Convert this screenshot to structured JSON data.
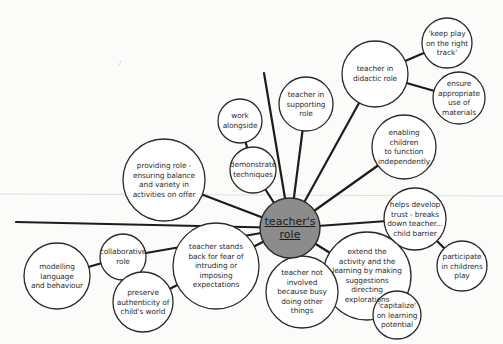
{
  "diagram": {
    "center": {
      "id": "center",
      "x": 290,
      "y": 228,
      "r": 30,
      "lines": [
        "teacher's",
        "role"
      ],
      "fill": "#8c8c8c"
    },
    "nodes": [
      {
        "id": "work-alongside",
        "x": 240,
        "y": 121,
        "r": 22,
        "lines": [
          "work",
          "alongside"
        ]
      },
      {
        "id": "demonstrate-techniques",
        "x": 253,
        "y": 170,
        "r": 23,
        "lines": [
          "demonstrate",
          "techniques"
        ]
      },
      {
        "id": "teacher-in-supporting-role",
        "x": 306,
        "y": 104,
        "r": 27,
        "lines": [
          "teacher in",
          "supporting",
          "role"
        ]
      },
      {
        "id": "teacher-in-didactic-role",
        "x": 375,
        "y": 74,
        "r": 33,
        "lines": [
          "teacher in",
          "didactic role"
        ]
      },
      {
        "id": "keep-play-on-track",
        "x": 447,
        "y": 43,
        "r": 25,
        "lines": [
          "'keep play",
          "on the right",
          "track'"
        ]
      },
      {
        "id": "ensure-appropriate-use",
        "x": 459,
        "y": 98,
        "r": 26,
        "lines": [
          "ensure",
          "appropriate",
          "use of",
          "materials"
        ]
      },
      {
        "id": "enabling-children",
        "x": 404,
        "y": 147,
        "r": 32,
        "lines": [
          "enabling",
          "children",
          "to function",
          "independently"
        ]
      },
      {
        "id": "providing-role",
        "x": 164,
        "y": 180,
        "r": 41,
        "lines": [
          "providing role -",
          "ensuring balance",
          "and variety in",
          "activities on offer"
        ]
      },
      {
        "id": "helps-develop-trust",
        "x": 415,
        "y": 219,
        "r": 31,
        "lines": [
          "helps develop",
          "trust - breaks",
          "down teacher...",
          "child barrier"
        ]
      },
      {
        "id": "participate-in-play",
        "x": 462,
        "y": 266,
        "r": 25,
        "lines": [
          "participate",
          "in childrens",
          "play"
        ]
      },
      {
        "id": "extend-the-activity",
        "x": 367,
        "y": 276,
        "r": 44,
        "lines": [
          "extend the",
          "activity and the",
          "learning by making",
          "suggestions",
          "directing",
          "explorations"
        ]
      },
      {
        "id": "capitalize-on-learning",
        "x": 397,
        "y": 315,
        "r": 24,
        "lines": [
          "'capitalize'",
          "on learning",
          "potential"
        ]
      },
      {
        "id": "teacher-not-involved",
        "x": 302,
        "y": 292,
        "r": 36,
        "lines": [
          "teacher not",
          "involved",
          "because busy",
          "doing other",
          "things"
        ]
      },
      {
        "id": "teacher-stands-back",
        "x": 216,
        "y": 266,
        "r": 43,
        "lines": [
          "teacher stands",
          "back for fear of",
          "intruding or",
          "imposing",
          "expectations"
        ]
      },
      {
        "id": "collaborative-role",
        "x": 123,
        "y": 257,
        "r": 23,
        "lines": [
          "collaborative",
          "role"
        ]
      },
      {
        "id": "modelling-language",
        "x": 57,
        "y": 276,
        "r": 33,
        "lines": [
          "modelling",
          "language",
          "and behaviour"
        ]
      },
      {
        "id": "preserve-authenticity",
        "x": 143,
        "y": 302,
        "r": 30,
        "lines": [
          "preserve",
          "authenticity of",
          "child's world"
        ]
      }
    ],
    "edges": [
      [
        "center",
        "demonstrate-techniques"
      ],
      [
        "work-alongside",
        "demonstrate-techniques"
      ],
      [
        "center",
        "teacher-in-supporting-role"
      ],
      [
        "center",
        "teacher-in-didactic-role"
      ],
      [
        "teacher-in-didactic-role",
        "keep-play-on-track"
      ],
      [
        "teacher-in-didactic-role",
        "ensure-appropriate-use"
      ],
      [
        "center",
        "enabling-children"
      ],
      [
        "center",
        "providing-role"
      ],
      [
        "center",
        "helps-develop-trust"
      ],
      [
        "helps-develop-trust",
        "participate-in-play"
      ],
      [
        "center",
        "extend-the-activity"
      ],
      [
        "extend-the-activity",
        "capitalize-on-learning"
      ],
      [
        "center",
        "teacher-not-involved"
      ],
      [
        "center",
        "teacher-stands-back"
      ],
      [
        "teacher-stands-back",
        "preserve-authenticity"
      ],
      [
        "center",
        "collaborative-role"
      ],
      [
        "collaborative-role",
        "modelling-language"
      ]
    ],
    "free_spokes": [
      {
        "id": "spoke-top",
        "x": 264,
        "y": 73
      },
      {
        "id": "spoke-left",
        "x": 16,
        "y": 222
      }
    ]
  }
}
